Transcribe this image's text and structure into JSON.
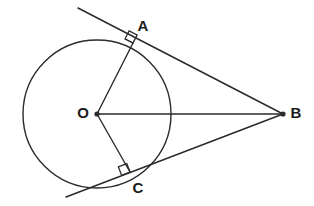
{
  "figure": {
    "kind": "geometry-diagram",
    "background_color": "#ffffff",
    "stroke_color": "#2b2b2b",
    "label_color": "#1a1a1a",
    "canvas": {
      "width": 314,
      "height": 206
    },
    "circle": {
      "name": "circle-o",
      "center": {
        "x": 97,
        "y": 114
      },
      "radius": 74,
      "stroke_width": 1.4,
      "fill": "none"
    },
    "points": [
      {
        "id": "O",
        "label": "O",
        "x": 97,
        "y": 114,
        "label_x": 83,
        "label_y": 114,
        "dot": true,
        "role": "center"
      },
      {
        "id": "A",
        "label": "A",
        "x": 133,
        "y": 43,
        "label_x": 143,
        "label_y": 27,
        "dot": false,
        "role": "tangent-point"
      },
      {
        "id": "B",
        "label": "B",
        "x": 283,
        "y": 114,
        "label_x": 296,
        "label_y": 114,
        "dot": true,
        "role": "external-point"
      },
      {
        "id": "C",
        "label": "C",
        "x": 130,
        "y": 172,
        "label_x": 138,
        "label_y": 189,
        "dot": false,
        "role": "tangent-point"
      }
    ],
    "segments": [
      {
        "name": "radius-oa",
        "from": "O",
        "to": "A",
        "x1": 97,
        "y1": 114,
        "x2": 133,
        "y2": 43,
        "stroke_width": 1.4
      },
      {
        "name": "radius-oc",
        "from": "O",
        "to": "C",
        "x1": 97,
        "y1": 114,
        "x2": 130,
        "y2": 172,
        "stroke_width": 1.4
      },
      {
        "name": "segment-ob",
        "from": "O",
        "to": "B",
        "x1": 97,
        "y1": 114,
        "x2": 283,
        "y2": 114,
        "stroke_width": 1.6
      },
      {
        "name": "tangent-line-upper",
        "from": "upper-extension",
        "to": "B",
        "x1": 78,
        "y1": 8,
        "x2": 283,
        "y2": 114,
        "stroke_width": 1.5
      },
      {
        "name": "tangent-line-lower",
        "from": "lower-extension",
        "to": "B",
        "x1": 66,
        "y1": 197,
        "x2": 283,
        "y2": 114,
        "stroke_width": 1.5
      }
    ],
    "right_angle_marks": [
      {
        "name": "right-angle-at-a",
        "vertex": "A",
        "size": 9,
        "rotation_deg": 27.3
      },
      {
        "name": "right-angle-at-c",
        "vertex": "C",
        "size": 9,
        "rotation_deg": -21.0
      }
    ]
  }
}
